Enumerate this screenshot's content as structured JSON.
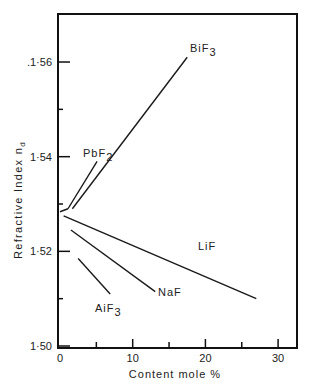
{
  "chart_data": {
    "type": "line",
    "title": "",
    "xlabel": "Content  mole %",
    "ylabel": "Refractive  Index   n",
    "ylabel_subscript": "d",
    "xlim": [
      0,
      32
    ],
    "ylim": [
      1.5,
      1.575
    ],
    "grid": false,
    "x_ticks": [
      0,
      10,
      20,
      30
    ],
    "x_tick_labels": [
      "0",
      "10",
      "20",
      "30"
    ],
    "x_minor_ticks": [
      5,
      15,
      25
    ],
    "y_ticks": [
      1.5,
      1.52,
      1.54,
      1.56
    ],
    "y_tick_labels": [
      "1·50",
      "1·52",
      "1·54",
      ".1·56"
    ],
    "y_minor_ticks": [
      1.51,
      1.53,
      1.55
    ],
    "series": [
      {
        "name": "BiF3",
        "label": "BiF",
        "label_sub": "3",
        "x": [
          1.7,
          17.5
        ],
        "y": [
          1.529,
          1.561
        ]
      },
      {
        "name": "PbF2",
        "label": "PbF",
        "label_sub": "2",
        "x": [
          1.1,
          5.1
        ],
        "y": [
          1.529,
          1.539
        ]
      },
      {
        "name": "LiF",
        "label": "LiF",
        "label_sub": "",
        "x": [
          0.5,
          27.0
        ],
        "y": [
          1.5275,
          1.51
        ]
      },
      {
        "name": "NaF",
        "label": "NaF",
        "label_sub": "",
        "x": [
          1.5,
          13.1
        ],
        "y": [
          1.5245,
          1.5115
        ]
      },
      {
        "name": "AiF3",
        "label": "AiF",
        "label_sub": "3",
        "x": [
          2.5,
          6.9
        ],
        "y": [
          1.5185,
          1.511
        ]
      }
    ],
    "origin_point": {
      "x": 0,
      "y": 1.529
    },
    "legend": "none (inline labels)"
  }
}
